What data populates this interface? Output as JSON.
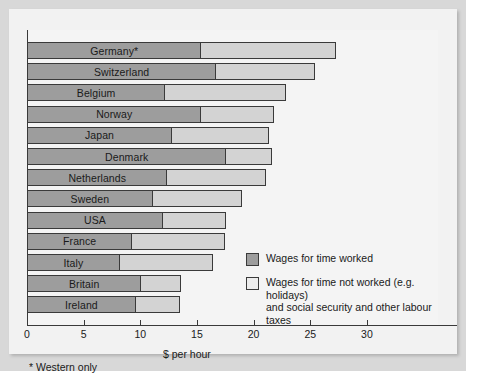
{
  "chart_data": {
    "type": "bar",
    "orientation": "horizontal",
    "stacked": true,
    "title": "",
    "xlabel": "$ per hour",
    "ylabel": "",
    "xlim": [
      0,
      36
    ],
    "xticks": [
      0,
      5,
      10,
      15,
      20,
      25,
      30
    ],
    "xtick_labels": [
      "0",
      "5",
      "10",
      "15",
      "20",
      "25",
      "30"
    ],
    "grid": false,
    "legend_position": "inside-right",
    "footnote": "* Western only",
    "categories": [
      "Germany*",
      "Switzerland",
      "Belgium",
      "Norway",
      "Japan",
      "Denmark",
      "Netherlands",
      "Sweden",
      "USA",
      "France",
      "Italy",
      "Britain",
      "Ireland"
    ],
    "series": [
      {
        "name": "Wages for time worked",
        "color": "#9d9d9d",
        "values": [
          15.4,
          16.7,
          12.2,
          15.4,
          12.8,
          17.6,
          12.4,
          11.1,
          12.0,
          9.3,
          8.2,
          10.1,
          9.6
        ]
      },
      {
        "name": "Wages for time not worked (e.g. holidays) and social security and other labour taxes",
        "color": "#d3d3d3",
        "values": [
          11.9,
          8.7,
          10.7,
          6.4,
          8.6,
          4.0,
          8.7,
          7.9,
          5.6,
          8.2,
          8.2,
          3.5,
          3.9
        ]
      }
    ],
    "totals": [
      27.3,
      25.4,
      22.9,
      21.8,
      21.4,
      21.6,
      21.1,
      19.0,
      17.6,
      17.5,
      16.4,
      13.6,
      13.5
    ]
  },
  "legend": {
    "items": [
      {
        "swatch": "dark",
        "label": "Wages for time worked"
      },
      {
        "swatch": "light",
        "label": "Wages for time not worked (e.g. holidays)\nand social security and other labour taxes"
      }
    ]
  },
  "axis": {
    "x_title": "$ per hour",
    "ticks": [
      "0",
      "5",
      "10",
      "15",
      "20",
      "25",
      "30"
    ]
  },
  "footnote": "* Western only"
}
